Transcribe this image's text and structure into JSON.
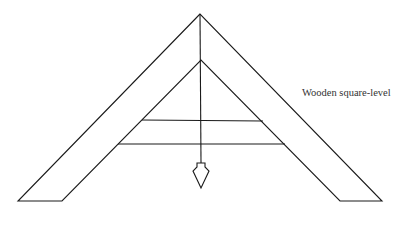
{
  "diagram": {
    "title": "Wooden square-level",
    "label": "Wooden square-level",
    "stroke_color": "#1a1a1a",
    "background": "#ffffff",
    "components": [
      {
        "name": "outer-frame",
        "description": "A-frame outer edge"
      },
      {
        "name": "inner-frame",
        "description": "A-frame inner edge"
      },
      {
        "name": "upper-crossbar",
        "description": "Upper horizontal bar"
      },
      {
        "name": "lower-crossbar",
        "description": "Lower horizontal bar"
      },
      {
        "name": "plumb-line",
        "description": "Vertical plumb line from apex"
      },
      {
        "name": "plumb-bob",
        "description": "Weight at end of plumb line"
      }
    ]
  }
}
